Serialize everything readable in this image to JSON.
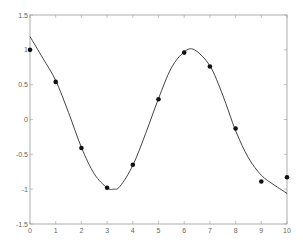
{
  "chart_data": {
    "type": "scatter",
    "title": "",
    "xlabel": "",
    "ylabel": "",
    "xlim": [
      0,
      10
    ],
    "ylim": [
      -1.5,
      1.5
    ],
    "grid": false,
    "legend": null,
    "x_ticks": [
      "0",
      "1",
      "2",
      "3",
      "4",
      "5",
      "6",
      "7",
      "8",
      "9",
      "10"
    ],
    "y_ticks": [
      "1.5",
      "1",
      "0.5",
      "0",
      "-0.5",
      "-1",
      "-1.5"
    ],
    "series": [
      {
        "name": "data points",
        "type": "scatter",
        "marker": "filled-circle",
        "color": "#111111",
        "x": [
          0,
          1,
          2,
          3,
          4,
          5,
          6,
          7,
          8,
          9,
          10
        ],
        "y": [
          1.0,
          0.54,
          -0.41,
          -0.98,
          -0.65,
          0.29,
          0.96,
          0.76,
          -0.13,
          -0.89,
          -0.83
        ]
      },
      {
        "name": "fitted curve",
        "type": "line",
        "color": "#444444",
        "x": [
          0,
          0.5,
          1,
          1.5,
          2,
          2.5,
          3,
          3.25,
          3.5,
          4,
          4.5,
          5,
          5.5,
          6,
          6.4,
          7,
          7.5,
          8,
          8.5,
          9,
          9.5,
          10
        ],
        "y": [
          1.19,
          0.88,
          0.56,
          0.1,
          -0.4,
          -0.78,
          -0.98,
          -1.0,
          -0.96,
          -0.66,
          -0.2,
          0.3,
          0.74,
          0.97,
          1.0,
          0.77,
          0.35,
          -0.16,
          -0.55,
          -0.8,
          -0.94,
          -1.06
        ]
      }
    ]
  }
}
